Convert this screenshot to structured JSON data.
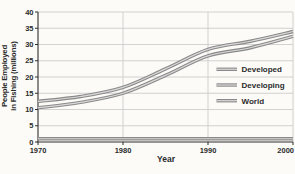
{
  "figure": {
    "x_axis_title": "Year",
    "y_axis_title_line1": "People Employed",
    "y_axis_title_line2": "in Fishing (millions)"
  },
  "chart_data": {
    "type": "line",
    "title": "",
    "xlabel": "Year",
    "ylabel": "People Employed in Fishing (millions)",
    "ylabel_lines": [
      "People Employed",
      "in Fishing (millions)"
    ],
    "x": [
      1970,
      1975,
      1980,
      1985,
      1990,
      1995,
      2000
    ],
    "x_ticks": [
      1970,
      1980,
      1990,
      2000
    ],
    "y_ticks": [
      0,
      5,
      10,
      15,
      20,
      25,
      30,
      35,
      40
    ],
    "xlim": [
      1970,
      2000
    ],
    "ylim": [
      0,
      40
    ],
    "grid": true,
    "legend_position": "right-middle",
    "legend_order": [
      "Developed",
      "Developing",
      "World"
    ],
    "series": [
      {
        "name": "Developed",
        "values": [
          1,
          1,
          1,
          1,
          1,
          1,
          1
        ]
      },
      {
        "name": "Developing",
        "values": [
          10.5,
          12.2,
          15,
          20.5,
          26.5,
          29,
          32.5
        ]
      },
      {
        "name": "World",
        "values": [
          12.5,
          14,
          16.8,
          22.5,
          28.5,
          31,
          34
        ]
      }
    ],
    "colors": {
      "background": "#fcfbf8",
      "grid": "#c8c8c8",
      "axis": "#2e2e2e",
      "text": "#2b2b2b",
      "line_outer": "#8a8a8a",
      "line_inner": "#d9d9d9"
    }
  }
}
